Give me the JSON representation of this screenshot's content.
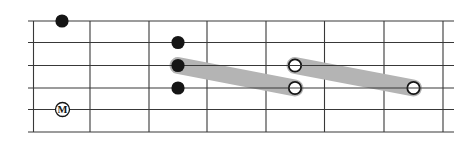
{
  "diagram": {
    "type": "fretboard-slide-diagram",
    "background_color": "#ffffff",
    "grid_color": "#383838",
    "note_color": "#151515",
    "slide_color": "#b4b4b4",
    "open_note_fill": "#ffffff",
    "grid": {
      "string_lines_y": [
        21,
        42.5,
        65.5,
        88,
        109.5,
        132
      ],
      "string_x_start": 28,
      "string_x_end": 454,
      "fret_lines_x": [
        33.5,
        90,
        149,
        207,
        266,
        324.5,
        384,
        443
      ],
      "fret_y_top": 21,
      "fret_y_bottom": 132
    },
    "filled_notes": [
      {
        "x": 62,
        "y": 21
      },
      {
        "x": 178,
        "y": 42.5
      },
      {
        "x": 178,
        "y": 65.5
      },
      {
        "x": 178,
        "y": 88
      }
    ],
    "open_notes": [
      {
        "x": 295,
        "y": 65.5
      },
      {
        "x": 295,
        "y": 88
      },
      {
        "x": 413.5,
        "y": 88
      }
    ],
    "slides": [
      {
        "from": {
          "x": 178,
          "y": 65.5
        },
        "to": {
          "x": 295,
          "y": 88
        }
      },
      {
        "from": {
          "x": 295,
          "y": 65.5
        },
        "to": {
          "x": 413.5,
          "y": 88
        }
      }
    ],
    "marker": {
      "label": "M",
      "x": 62.5,
      "y": 109.5
    },
    "style": {
      "grid_stroke": 1.1,
      "slide_thickness": 17,
      "filled_radius": 6.6,
      "open_radius": 6.2,
      "open_stroke": 1.8,
      "marker_radius": 7,
      "marker_stroke": 1.3,
      "marker_font_size": 10.5
    }
  }
}
